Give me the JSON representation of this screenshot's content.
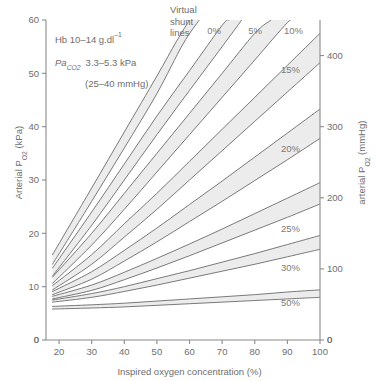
{
  "chart_data": {
    "type": "line",
    "title": "",
    "xlabel": "Inspired oxygen concentration (%)",
    "ylabel": "Arterial Po2 (kPa)",
    "y2label": "arterial Po2 (mmHg)",
    "xlim": [
      16,
      100
    ],
    "ylim": [
      0,
      60
    ],
    "y2lim": [
      0,
      450
    ],
    "grid": false,
    "legend_position": "in-plot-labels",
    "xticks": [
      20,
      30,
      40,
      50,
      60,
      70,
      80,
      90,
      100
    ],
    "yticks": [
      0,
      10,
      20,
      30,
      40,
      50,
      60
    ],
    "y2ticks": [
      0,
      100,
      200,
      300,
      400
    ],
    "x_origin_label": "0",
    "x_end_label": "0",
    "series": [
      {
        "name": "0%",
        "label": "0%",
        "upper": [
          [
            18,
            16.0
          ],
          [
            30,
            28.5
          ],
          [
            40,
            39.0
          ],
          [
            50,
            49.5
          ],
          [
            56,
            56.0
          ],
          [
            60,
            60.0
          ]
        ],
        "lower": [
          [
            18,
            14.2
          ],
          [
            30,
            26.0
          ],
          [
            40,
            36.0
          ],
          [
            50,
            46.2
          ],
          [
            58,
            55.5
          ],
          [
            63,
            60.0
          ]
        ]
      },
      {
        "name": "5%",
        "label": "5%",
        "upper": [
          [
            18,
            13.5
          ],
          [
            30,
            24.0
          ],
          [
            40,
            33.0
          ],
          [
            50,
            42.0
          ],
          [
            60,
            50.5
          ],
          [
            70,
            59.0
          ],
          [
            72,
            60.0
          ]
        ],
        "lower": [
          [
            18,
            12.0
          ],
          [
            30,
            21.5
          ],
          [
            40,
            30.0
          ],
          [
            50,
            38.5
          ],
          [
            60,
            46.8
          ],
          [
            70,
            55.0
          ],
          [
            76,
            60.0
          ]
        ]
      },
      {
        "name": "10%",
        "label": "10%",
        "upper": [
          [
            18,
            11.8
          ],
          [
            30,
            20.0
          ],
          [
            40,
            27.5
          ],
          [
            50,
            35.0
          ],
          [
            60,
            42.5
          ],
          [
            70,
            50.0
          ],
          [
            80,
            57.5
          ],
          [
            85,
            60.0
          ]
        ],
        "lower": [
          [
            18,
            10.6
          ],
          [
            30,
            17.8
          ],
          [
            40,
            24.5
          ],
          [
            50,
            31.5
          ],
          [
            60,
            38.5
          ],
          [
            70,
            45.5
          ],
          [
            80,
            52.5
          ],
          [
            90,
            59.5
          ],
          [
            92,
            60.0
          ]
        ]
      },
      {
        "name": "15%",
        "label": "15%",
        "upper": [
          [
            18,
            10.2
          ],
          [
            30,
            16.0
          ],
          [
            40,
            21.8
          ],
          [
            50,
            27.5
          ],
          [
            60,
            33.5
          ],
          [
            70,
            39.5
          ],
          [
            80,
            45.5
          ],
          [
            90,
            51.5
          ],
          [
            100,
            57.5
          ]
        ],
        "lower": [
          [
            18,
            9.4
          ],
          [
            30,
            14.2
          ],
          [
            40,
            19.3
          ],
          [
            50,
            24.5
          ],
          [
            60,
            30.0
          ],
          [
            70,
            35.5
          ],
          [
            80,
            41.0
          ],
          [
            90,
            46.5
          ],
          [
            100,
            52.0
          ]
        ]
      },
      {
        "name": "20%",
        "label": "20%",
        "upper": [
          [
            18,
            9.1
          ],
          [
            30,
            12.8
          ],
          [
            40,
            16.8
          ],
          [
            50,
            21.0
          ],
          [
            60,
            25.4
          ],
          [
            70,
            29.8
          ],
          [
            80,
            34.3
          ],
          [
            90,
            38.8
          ],
          [
            100,
            43.3
          ]
        ],
        "lower": [
          [
            18,
            8.5
          ],
          [
            30,
            11.4
          ],
          [
            40,
            14.8
          ],
          [
            50,
            18.4
          ],
          [
            60,
            22.2
          ],
          [
            70,
            26.0
          ],
          [
            80,
            29.9
          ],
          [
            90,
            33.8
          ],
          [
            100,
            37.8
          ]
        ]
      },
      {
        "name": "25%",
        "label": "25%",
        "upper": [
          [
            18,
            8.2
          ],
          [
            30,
            10.3
          ],
          [
            40,
            12.7
          ],
          [
            50,
            15.3
          ],
          [
            60,
            18.0
          ],
          [
            70,
            20.8
          ],
          [
            80,
            23.7
          ],
          [
            90,
            26.6
          ],
          [
            100,
            29.5
          ]
        ],
        "lower": [
          [
            18,
            7.7
          ],
          [
            30,
            9.3
          ],
          [
            40,
            11.3
          ],
          [
            50,
            13.5
          ],
          [
            60,
            15.8
          ],
          [
            70,
            18.2
          ],
          [
            80,
            20.6
          ],
          [
            90,
            23.0
          ],
          [
            100,
            25.5
          ]
        ]
      },
      {
        "name": "30%",
        "label": "30%",
        "upper": [
          [
            18,
            7.5
          ],
          [
            30,
            8.7
          ],
          [
            40,
            10.0
          ],
          [
            50,
            11.5
          ],
          [
            60,
            13.0
          ],
          [
            70,
            14.6
          ],
          [
            80,
            16.2
          ],
          [
            90,
            17.9
          ],
          [
            100,
            19.6
          ]
        ],
        "lower": [
          [
            18,
            7.1
          ],
          [
            30,
            8.0
          ],
          [
            40,
            9.1
          ],
          [
            50,
            10.3
          ],
          [
            60,
            11.6
          ],
          [
            70,
            12.9
          ],
          [
            80,
            14.2
          ],
          [
            90,
            15.6
          ],
          [
            100,
            17.0
          ]
        ]
      },
      {
        "name": "50%",
        "label": "50%",
        "upper": [
          [
            18,
            6.3
          ],
          [
            30,
            6.6
          ],
          [
            40,
            6.9
          ],
          [
            50,
            7.3
          ],
          [
            60,
            7.7
          ],
          [
            70,
            8.1
          ],
          [
            80,
            8.5
          ],
          [
            90,
            9.0
          ],
          [
            100,
            9.4
          ]
        ],
        "lower": [
          [
            18,
            5.8
          ],
          [
            30,
            6.0
          ],
          [
            40,
            6.2
          ],
          [
            50,
            6.5
          ],
          [
            60,
            6.8
          ],
          [
            70,
            7.1
          ],
          [
            80,
            7.4
          ],
          [
            90,
            7.7
          ],
          [
            100,
            8.0
          ]
        ]
      }
    ],
    "annotations": {
      "callout": "Virtual\nshunt\nlines",
      "callout_line1": "Virtual",
      "callout_line2": "shunt",
      "callout_line3": "lines",
      "note_hb": "Hb 10–14 g.dl",
      "note_hb_sup": "–1",
      "note_paco2_symbol": "Pa",
      "note_paco2_sub": "CO",
      "note_paco2_sub2": "2",
      "note_paco2_value": "3.3–5.3 kPa",
      "note_paco2_mmhg": "(25–40 mmHg)"
    },
    "colors": {
      "band_fill": "#ececec",
      "band_edge": "#6b6b6b",
      "axis": "#8a8a8a",
      "text": "#6e6e6e",
      "background": "#ffffff"
    }
  },
  "axes": {
    "left_title_main": "Arterial P",
    "left_title_sub": "O",
    "left_title_sub2": "2",
    "left_title_unit": " (kPa)",
    "right_title_main": "arterial P",
    "right_title_sub": "O",
    "right_title_sub2": "2",
    "right_title_unit": " (mmHg)",
    "bottom_title": "Inspired oxygen concentration (%)"
  }
}
